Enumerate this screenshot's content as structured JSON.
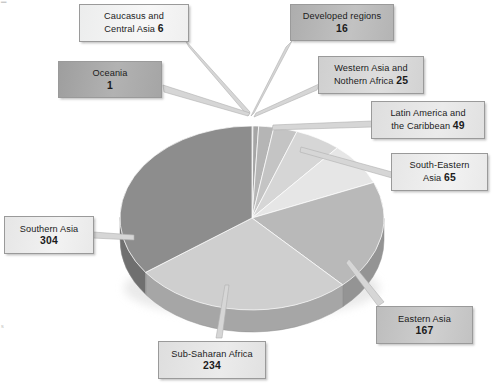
{
  "chart_data": {
    "type": "pie",
    "title": "",
    "subtitle": "",
    "xlabel": "",
    "ylabel": "",
    "legend_position": "callout-labels",
    "grid": false,
    "total": 867,
    "units": "millions",
    "categories": [
      "Caucasus and Central Asia",
      "Developed regions",
      "Western Asia and Nothern Africa",
      "Latin America and the Caribbean",
      "South-Eastern Asia",
      "Eastern Asia",
      "Sub-Saharan Africa",
      "Southern Asia",
      "Oceania"
    ],
    "values": [
      6,
      16,
      25,
      49,
      65,
      167,
      234,
      304,
      1
    ],
    "slice_order_clockwise_from_top": [
      "Oceania",
      "Caucasus and Central Asia",
      "Developed regions",
      "Western Asia and Nothern Africa",
      "Latin America and the Caribbean",
      "South-Eastern Asia",
      "Eastern Asia",
      "Sub-Saharan Africa",
      "Southern Asia"
    ],
    "colors": [
      "#b6b6b6",
      "#9f9f9f",
      "#aeaeae",
      "#c6c6c6",
      "#dadada",
      "#e9e9e9",
      "#b9b9b9",
      "#cfcfcf",
      "#8e8e8e"
    ]
  },
  "chart": {
    "style": "3d-pie",
    "slices": [
      {
        "key": "oceania",
        "label": "Oceania",
        "value_text": "1",
        "value": 1,
        "color": "#8f8f8f",
        "side_color": "#717171",
        "tone": "tone-xdark"
      },
      {
        "key": "caucasus",
        "label_line1": "Caucasus and",
        "label_line2": "Central Asia",
        "value_text": "6",
        "value": 6,
        "color": "#a6a6a6",
        "side_color": "#868686",
        "tone": "tone-white"
      },
      {
        "key": "developed",
        "label": "Developed regions",
        "value_text": "16",
        "value": 16,
        "color": "#b5b5b5",
        "side_color": "#919191",
        "tone": "tone-dark"
      },
      {
        "key": "western-asia",
        "label_line1": "Western Asia and",
        "label_line2": "Nothern Africa",
        "value_text": "25",
        "value": 25,
        "color": "#c4c4c4",
        "side_color": "#9e9e9e",
        "tone": "tone-light"
      },
      {
        "key": "latin-america",
        "label_line1": "Latin America and",
        "label_line2": "the Caribbean",
        "value_text": "49",
        "value": 49,
        "color": "#d6d6d6",
        "side_color": "#acacac",
        "tone": "tone-xlight"
      },
      {
        "key": "south-eastern",
        "label_line1": "South-Eastern",
        "label_line2": "Asia",
        "value_text": "65",
        "value": 65,
        "color": "#e6e6e6",
        "side_color": "#bababa",
        "tone": "tone-pale"
      },
      {
        "key": "eastern-asia",
        "label": "Eastern Asia",
        "value_text": "167",
        "value": 167,
        "color": "#b9b9b9",
        "side_color": "#949494",
        "tone": "tone-mid"
      },
      {
        "key": "sub-saharan",
        "label": "Sub-Saharan Africa",
        "value_text": "234",
        "value": 234,
        "color": "#cfcfcf",
        "side_color": "#a6a6a6",
        "tone": "tone-xlight"
      },
      {
        "key": "southern-asia",
        "label": "Southern Asia",
        "value_text": "304",
        "value": 304,
        "color": "#8d8d8d",
        "side_color": "#6f6f6f",
        "tone": "tone-pale"
      }
    ]
  },
  "labels": {
    "caucasus": {
      "line1": "Caucasus and",
      "line2": "Central Asia",
      "value": "6"
    },
    "oceania": {
      "line1": "Oceania",
      "value": "1"
    },
    "developed": {
      "line1": "Developed regions",
      "value": "16"
    },
    "western_asia": {
      "line1": "Western Asia and",
      "line2": "Nothern Africa",
      "value": "25"
    },
    "latin_america": {
      "line1": "Latin America and",
      "line2": "the Caribbean",
      "value": "49"
    },
    "south_eastern": {
      "line1": "South-Eastern",
      "line2": "Asia",
      "value": "65"
    },
    "eastern_asia": {
      "line1": "Eastern Asia",
      "value": "167"
    },
    "sub_saharan": {
      "line1": "Sub-Saharan Africa",
      "value": "234"
    },
    "southern_asia": {
      "line1": "Southern Asia",
      "value": "304"
    }
  }
}
